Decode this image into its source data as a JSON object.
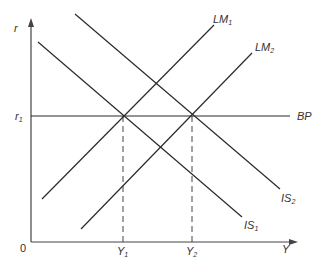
{
  "diagram": {
    "type": "IS-LM-BP",
    "axes": {
      "y_label": "r",
      "x_label": "Y",
      "origin_label": "0"
    },
    "levels": {
      "r1": {
        "base": "r",
        "sub": "1"
      },
      "Y1": {
        "base": "Y",
        "sub": "1"
      },
      "Y2": {
        "base": "Y",
        "sub": "2"
      }
    },
    "curves": {
      "LM1": {
        "base": "LM",
        "sub": "1"
      },
      "LM2": {
        "base": "LM",
        "sub": "2"
      },
      "IS1": {
        "base": "IS",
        "sub": "1"
      },
      "IS2": {
        "base": "IS",
        "sub": "2"
      },
      "BP": {
        "base": "BP"
      }
    },
    "colors": {
      "line": "#2a2a2a",
      "text": "#333333",
      "background": "#ffffff"
    }
  }
}
